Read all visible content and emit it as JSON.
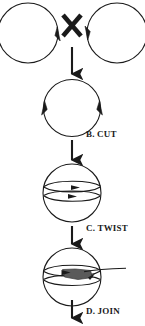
{
  "figure": {
    "background_color": "#ffffff",
    "stroke_color": "#1a1a1a",
    "fill_color": "#5a5a5a",
    "width": 145,
    "height": 326
  },
  "operator": {
    "symbol": "✕",
    "name": "cross-multiply-operator"
  },
  "stages": [
    {
      "id": "stage-a",
      "label": "",
      "description": "two separate circular loops joined by a cross operator"
    },
    {
      "id": "stage-b",
      "label": "B. CUT",
      "description": "single circle with arrowheads at left and right cut points"
    },
    {
      "id": "stage-c",
      "label": "C. TWIST",
      "description": "circle with two horizontal bands and rightward arrows"
    },
    {
      "id": "stage-d",
      "label": "D. JOIN",
      "description": "circle with filled joined wedge and trailing strand"
    }
  ],
  "labels": {
    "cut": "B. CUT",
    "twist": "C. TWIST",
    "join": "D. JOIN"
  },
  "arrows": {
    "flow_direction": "down",
    "count": 4
  }
}
